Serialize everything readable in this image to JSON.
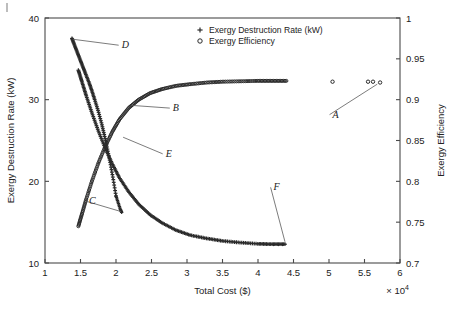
{
  "chart_data": {
    "type": "scatter",
    "title": "",
    "xlabel": "Total Cost ($)",
    "ylabel": "Exergy Destruction Rate (kW)",
    "y2label": "Exergy Efficiency",
    "x_multiplier": "× 10",
    "x_multiplier_exp": "4",
    "xlim": [
      1,
      6
    ],
    "ylim": [
      10,
      40
    ],
    "y2lim": [
      0.7,
      1
    ],
    "xticks": [
      "1",
      "1.5",
      "2",
      "2.5",
      "3",
      "3.5",
      "4",
      "4.5",
      "5",
      "5.5",
      "6"
    ],
    "xtick_values": [
      1,
      1.5,
      2,
      2.5,
      3,
      3.5,
      4,
      4.5,
      5,
      5.5,
      6
    ],
    "yticks": [
      "10",
      "20",
      "30",
      "40"
    ],
    "ytick_values": [
      10,
      20,
      30,
      40
    ],
    "y2ticks": [
      "0.7",
      "0.75",
      "0.8",
      "0.85",
      "0.9",
      "0.95",
      "1"
    ],
    "y2tick_values": [
      0.7,
      0.75,
      0.8,
      0.85,
      0.9,
      0.95,
      1
    ],
    "grid": false,
    "legend_position": "top-center",
    "legend": [
      {
        "marker": "plus",
        "label": "Exergy Destruction Rate (kW)"
      },
      {
        "marker": "circle",
        "label": "Exergy Efficiency"
      }
    ],
    "series": [
      {
        "name": "Exergy Destruction Rate (kW)",
        "marker": "plus",
        "axis": "left",
        "comment": "Upper branch D: steeply decreasing from (1.38,37.5) down to the crossing; lower branch E/F: decaying to a plateau near 12.3 kW",
        "branch_D": {
          "x": [
            1.38,
            1.41,
            1.45,
            1.49,
            1.53,
            1.57,
            1.62,
            1.66,
            1.7,
            1.75,
            1.8,
            1.84,
            1.88,
            1.92,
            1.96,
            2.0
          ],
          "y": [
            37.5,
            36.8,
            35.9,
            35.0,
            34.1,
            33.2,
            32.1,
            31.1,
            30.0,
            28.6,
            27.0,
            25.5,
            23.9,
            22.2,
            20.3,
            18.2
          ]
        },
        "branch_C_tail": {
          "x": [
            2.0,
            2.03,
            2.06,
            2.08
          ],
          "y": [
            18.2,
            17.4,
            16.6,
            16.2
          ]
        },
        "branch_E": {
          "x": [
            1.47,
            1.52,
            1.58,
            1.66,
            1.75,
            1.85,
            1.95,
            2.05,
            2.18,
            2.32,
            2.48,
            2.65,
            2.85,
            3.05,
            3.28,
            3.5,
            3.75,
            4.0,
            4.2,
            4.38
          ],
          "y": [
            33.6,
            32.2,
            30.5,
            28.4,
            26.2,
            24.0,
            22.1,
            20.4,
            18.7,
            17.2,
            15.9,
            14.9,
            14.0,
            13.4,
            13.0,
            12.7,
            12.5,
            12.35,
            12.3,
            12.3
          ]
        }
      },
      {
        "name": "Exergy Efficiency",
        "marker": "circle",
        "axis": "right",
        "comment": "Rising branch B saturating at ~0.923, plus isolated outlier points A at high cost",
        "branch_B": {
          "x": [
            1.47,
            1.52,
            1.58,
            1.66,
            1.75,
            1.85,
            1.95,
            2.05,
            2.18,
            2.32,
            2.48,
            2.65,
            2.85,
            3.05,
            3.28,
            3.5,
            3.75,
            4.0,
            4.2,
            4.4
          ],
          "y": [
            0.745,
            0.76,
            0.778,
            0.8,
            0.822,
            0.843,
            0.861,
            0.876,
            0.89,
            0.9,
            0.908,
            0.913,
            0.917,
            0.919,
            0.921,
            0.922,
            0.9225,
            0.923,
            0.923,
            0.923
          ]
        },
        "outliers_A": {
          "x": [
            5.05,
            5.55,
            5.62,
            5.72
          ],
          "y": [
            0.922,
            0.922,
            0.922,
            0.921
          ]
        }
      }
    ],
    "annotations": [
      {
        "label": "A",
        "text_x": 5.05,
        "text_y": 0.878,
        "point_x": 5.68,
        "point_y": 0.919,
        "axis": "right"
      },
      {
        "label": "B",
        "text_x": 2.8,
        "text_y": 28.6,
        "point_x": 2.22,
        "point_y": 0.893,
        "axis": "mixed"
      },
      {
        "label": "C",
        "text_x": 1.62,
        "text_y": 17.2,
        "point_x": 2.07,
        "point_y": 16.3,
        "axis": "left"
      },
      {
        "label": "D",
        "text_x": 2.08,
        "text_y": 36.3,
        "point_x": 1.39,
        "point_y": 37.4,
        "axis": "left"
      },
      {
        "label": "E",
        "text_x": 2.7,
        "text_y": 23.0,
        "point_x": 2.1,
        "point_y": 25.4,
        "axis": "left"
      },
      {
        "label": "F",
        "text_x": 4.22,
        "text_y": 18.9,
        "point_x": 4.38,
        "point_y": 12.6,
        "axis": "left"
      }
    ]
  }
}
